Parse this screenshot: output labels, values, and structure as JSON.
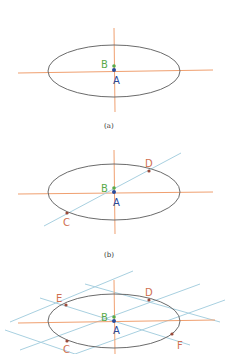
{
  "colors": {
    "ellipse": "#6b6b6b",
    "axis": "#f0a070",
    "tangent": "#a8d0e0",
    "point_A": "#2a4a9a",
    "point_B": "#5aaa4a",
    "points_other": "#9a4a3a",
    "label_other": "#d07050"
  },
  "panels": [
    {
      "caption": "(a)",
      "labels": {
        "A": "A",
        "B": "B"
      }
    },
    {
      "caption": "(b)",
      "labels": {
        "A": "A",
        "B": "B",
        "C": "C",
        "D": "D"
      }
    },
    {
      "labels": {
        "A": "A",
        "B": "B",
        "C": "C",
        "D": "D",
        "E": "E",
        "F": "F"
      }
    }
  ]
}
